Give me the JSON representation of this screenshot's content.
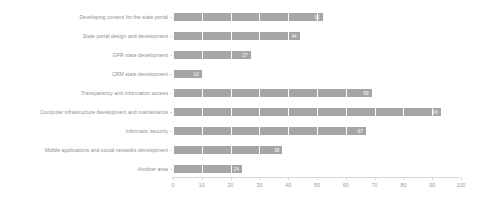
{
  "chart_data": {
    "type": "bar",
    "orientation": "horizontal",
    "title": "",
    "subtitle": "",
    "xlabel": "",
    "ylabel": "",
    "xlim": [
      0,
      100
    ],
    "xticks": [
      "0",
      "10",
      "20",
      "30",
      "40",
      "50",
      "60",
      "70",
      "80",
      "90",
      "100"
    ],
    "grid": false,
    "legend": "none",
    "categories": [
      "Developing content for the state portal",
      "State portal design and development",
      "GPR state development",
      "CRM state development",
      "Transparency and information access",
      "Computer infrastructure development and maintenance",
      "Informatic security",
      "Mobile applications and social networks development",
      "Another area"
    ],
    "values": [
      52,
      44,
      27,
      10,
      69,
      93,
      67,
      38,
      24
    ],
    "value_labels": [
      "52",
      "44",
      "27",
      "10",
      "69",
      "93",
      "67",
      "38",
      "24"
    ],
    "bar_color": "#a6a6a6",
    "value_label_color": "#ffffff",
    "axis_color": "#d8d8d8",
    "text_color": "#8f8f8f"
  }
}
